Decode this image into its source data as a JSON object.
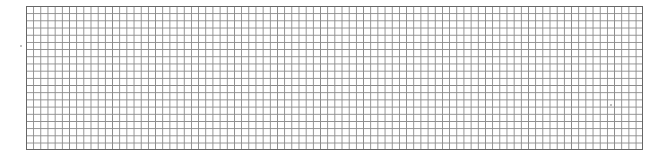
{
  "grid": {
    "columns": 86,
    "rows": 20,
    "line_color": "#8a8a8a",
    "border_color": "#666666",
    "background": "#ffffff"
  }
}
